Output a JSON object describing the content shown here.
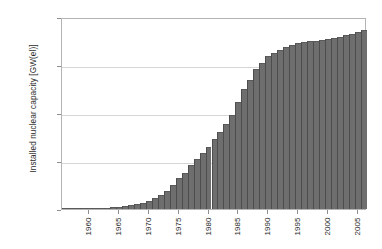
{
  "chart_data": {
    "type": "bar",
    "title": "",
    "xlabel": "",
    "ylabel": "Installed nuclear capacity [GW(el)]",
    "ylim": [
      0,
      400
    ],
    "xlim": [
      1955.5,
      2006.5
    ],
    "ytick_labels": [
      "400",
      "300",
      "200",
      "100",
      "0"
    ],
    "ytick_values": [
      400,
      300,
      200,
      100,
      0
    ],
    "xtick_labels": [
      "1960",
      "1965",
      "1970",
      "1975",
      "1980",
      "1985",
      "1990",
      "1995",
      "2000",
      "2005"
    ],
    "xtick_values": [
      1960,
      1965,
      1970,
      1975,
      1980,
      1985,
      1990,
      1995,
      2000,
      2005
    ],
    "grid": true,
    "legend": "none",
    "bar_color": "#6e6e6e",
    "categories": [
      1956,
      1957,
      1958,
      1959,
      1960,
      1961,
      1962,
      1963,
      1964,
      1965,
      1966,
      1967,
      1968,
      1969,
      1970,
      1971,
      1972,
      1973,
      1974,
      1975,
      1976,
      1977,
      1978,
      1979,
      1980,
      1981,
      1982,
      1983,
      1984,
      1985,
      1986,
      1987,
      1988,
      1989,
      1990,
      1991,
      1992,
      1993,
      1994,
      1995,
      1996,
      1997,
      1998,
      1999,
      2000,
      2001,
      2002,
      2003,
      2004,
      2005,
      2006
    ],
    "values": [
      0.1,
      0.2,
      0.4,
      0.7,
      1.0,
      1.5,
      2.2,
      3.0,
      4.0,
      5.0,
      6.5,
      8.0,
      10.0,
      13.0,
      17.0,
      22.0,
      29.0,
      38.0,
      49.0,
      64.0,
      76.0,
      92.0,
      105.0,
      117.0,
      129.0,
      146.0,
      160.0,
      177.0,
      196.0,
      223.0,
      250.0,
      268.0,
      292.0,
      305.0,
      318.0,
      326.0,
      332.0,
      337.0,
      341.0,
      345.0,
      348.0,
      350.0,
      351.0,
      353.0,
      355.0,
      357.0,
      359.0,
      362.0,
      365.0,
      368.0,
      372.0
    ]
  }
}
